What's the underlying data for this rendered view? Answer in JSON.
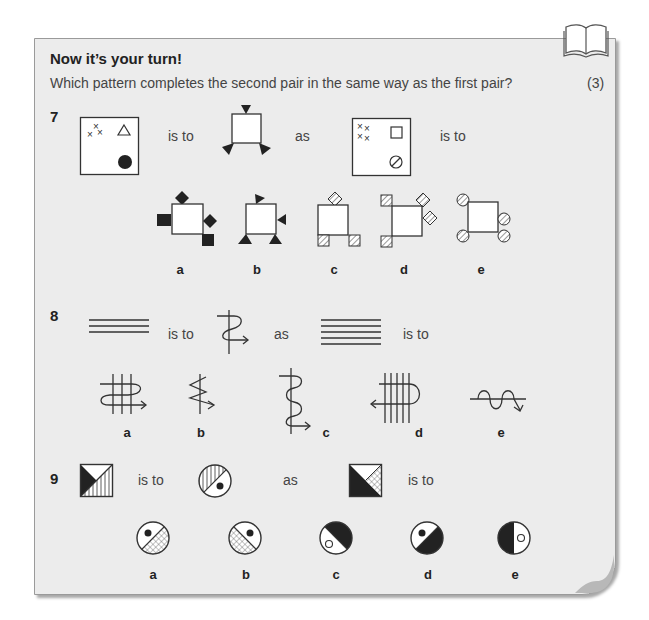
{
  "header": {
    "title": "Now it’s your turn!",
    "instruction": "Which pattern completes the second pair in the same way as the first pair?",
    "marks": "(3)",
    "icon": "book-icon"
  },
  "questions": [
    {
      "number": "7",
      "connectors": {
        "is_to_1": "is to",
        "as": "as",
        "is_to_2": "is to"
      },
      "options": [
        "a",
        "b",
        "c",
        "d",
        "e"
      ]
    },
    {
      "number": "8",
      "connectors": {
        "is_to_1": "is to",
        "as": "as",
        "is_to_2": "is to"
      },
      "options": [
        "a",
        "b",
        "c",
        "d",
        "e"
      ]
    },
    {
      "number": "9",
      "connectors": {
        "is_to_1": "is to",
        "as": "as",
        "is_to_2": "is to"
      },
      "options": [
        "a",
        "b",
        "c",
        "d",
        "e"
      ]
    }
  ]
}
